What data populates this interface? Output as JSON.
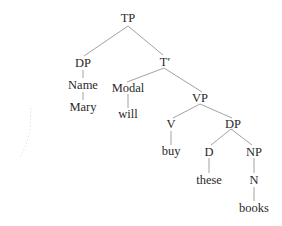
{
  "diagram": {
    "type": "syntax-tree",
    "nodes": {
      "tp": {
        "label": "TP",
        "x": 128,
        "y": 18
      },
      "dp_subject": {
        "label": "DP",
        "x": 83,
        "y": 64
      },
      "name": {
        "label": "Name",
        "x": 83,
        "y": 86
      },
      "mary": {
        "label": "Mary",
        "x": 83,
        "y": 108
      },
      "t_bar": {
        "label": "T′",
        "x": 165,
        "y": 64
      },
      "modal": {
        "label": "Modal",
        "x": 123,
        "y": 88
      },
      "will": {
        "label": "will",
        "x": 123,
        "y": 115
      },
      "vp": {
        "label": "VP",
        "x": 205,
        "y": 100
      },
      "v": {
        "label": "V",
        "x": 171,
        "y": 125
      },
      "buy": {
        "label": "buy",
        "x": 171,
        "y": 153
      },
      "dp_object": {
        "label": "DP",
        "x": 234,
        "y": 125
      },
      "d": {
        "label": "D",
        "x": 209,
        "y": 152
      },
      "these": {
        "label": "these",
        "x": 209,
        "y": 181
      },
      "np": {
        "label": "NP",
        "x": 254,
        "y": 152
      },
      "n": {
        "label": "N",
        "x": 254,
        "y": 181
      },
      "books": {
        "label": "books",
        "x": 254,
        "y": 209
      }
    },
    "edges": [
      [
        "tp",
        "dp_subject"
      ],
      [
        "tp",
        "t_bar"
      ],
      [
        "dp_subject",
        "name"
      ],
      [
        "name",
        "mary"
      ],
      [
        "t_bar",
        "modal"
      ],
      [
        "t_bar",
        "vp"
      ],
      [
        "modal",
        "will"
      ],
      [
        "vp",
        "v"
      ],
      [
        "vp",
        "dp_object"
      ],
      [
        "v",
        "buy"
      ],
      [
        "dp_object",
        "d"
      ],
      [
        "dp_object",
        "np"
      ],
      [
        "d",
        "these"
      ],
      [
        "np",
        "n"
      ],
      [
        "n",
        "books"
      ]
    ],
    "colors": {
      "line": "#8a8a8a",
      "text": "#2a2a2a",
      "background": "#ffffff"
    }
  }
}
